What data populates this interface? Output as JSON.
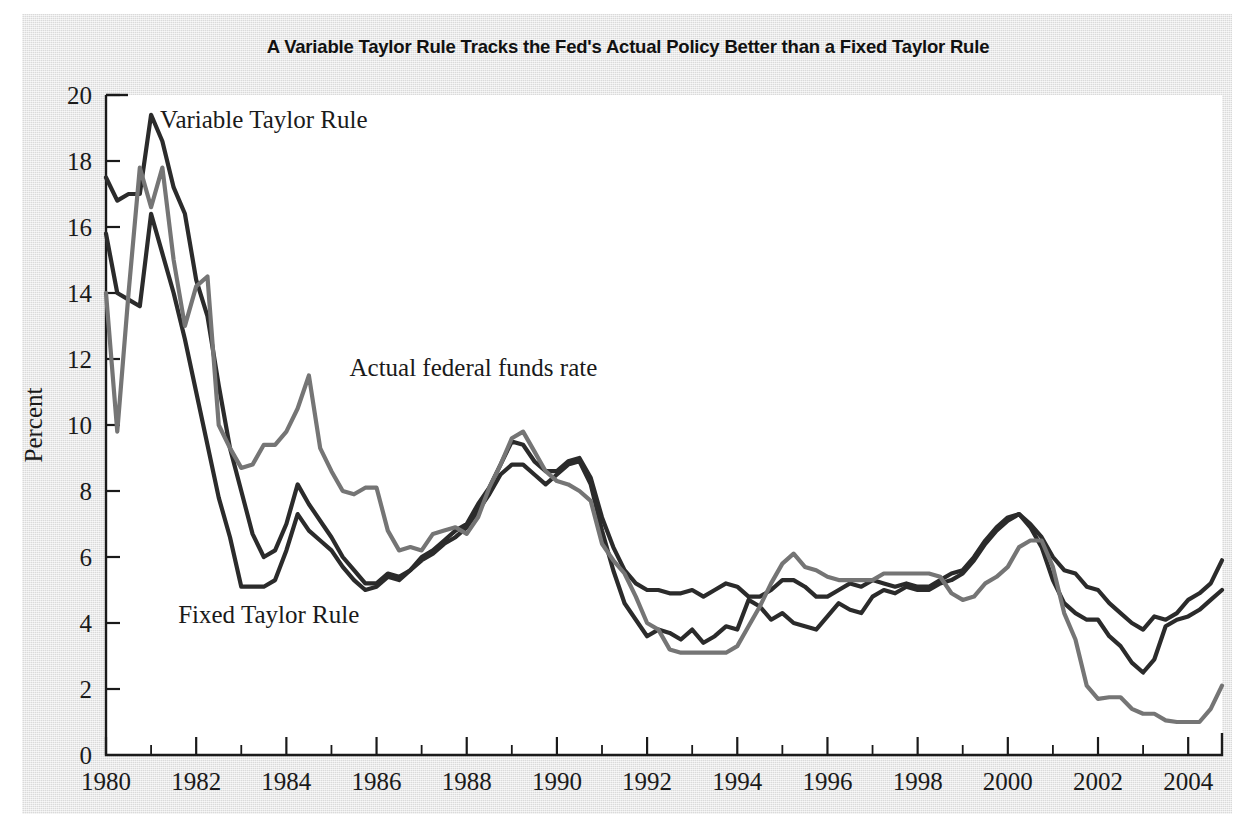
{
  "chart_data": {
    "type": "line",
    "title": "A Variable Taylor Rule Tracks the Fed's Actual Policy Better than a Fixed Taylor Rule",
    "xlabel": "",
    "ylabel": "Percent",
    "xlim": [
      1980.0,
      2004.75
    ],
    "ylim": [
      0,
      20
    ],
    "ytick_values": [
      0,
      2,
      4,
      6,
      8,
      10,
      12,
      14,
      16,
      18,
      20
    ],
    "ytick_labels": [
      "0",
      "2",
      "4",
      "6",
      "8",
      "10",
      "12",
      "14",
      "16",
      "18",
      "20"
    ],
    "xtick_values": [
      1980,
      1982,
      1984,
      1986,
      1988,
      1990,
      1992,
      1994,
      1996,
      1998,
      2000,
      2002,
      2004
    ],
    "xtick_labels": [
      "1980",
      "1982",
      "1984",
      "1986",
      "1988",
      "1990",
      "1992",
      "1994",
      "1996",
      "1998",
      "2000",
      "2002",
      "2004"
    ],
    "xminor_values": [
      1981,
      1983,
      1985,
      1987,
      1989,
      1991,
      1993,
      1995,
      1997,
      1999,
      2001,
      2003
    ],
    "grid": false,
    "legend_position": "inline-annotations",
    "x": [
      1980.0,
      1980.25,
      1980.5,
      1980.75,
      1981.0,
      1981.25,
      1981.5,
      1981.75,
      1982.0,
      1982.25,
      1982.5,
      1982.75,
      1983.0,
      1983.25,
      1983.5,
      1983.75,
      1984.0,
      1984.25,
      1984.5,
      1984.75,
      1985.0,
      1985.25,
      1985.5,
      1985.75,
      1986.0,
      1986.25,
      1986.5,
      1986.75,
      1987.0,
      1987.25,
      1987.5,
      1987.75,
      1988.0,
      1988.25,
      1988.5,
      1988.75,
      1989.0,
      1989.25,
      1989.5,
      1989.75,
      1990.0,
      1990.25,
      1990.5,
      1990.75,
      1991.0,
      1991.25,
      1991.5,
      1991.75,
      1992.0,
      1992.25,
      1992.5,
      1992.75,
      1993.0,
      1993.25,
      1993.5,
      1993.75,
      1994.0,
      1994.25,
      1994.5,
      1994.75,
      1995.0,
      1995.25,
      1995.5,
      1995.75,
      1996.0,
      1996.25,
      1996.5,
      1996.75,
      1997.0,
      1997.25,
      1997.5,
      1997.75,
      1998.0,
      1998.25,
      1998.5,
      1998.75,
      1999.0,
      1999.25,
      1999.5,
      1999.75,
      2000.0,
      2000.25,
      2000.5,
      2000.75,
      2001.0,
      2001.25,
      2001.5,
      2001.75,
      2002.0,
      2002.25,
      2002.5,
      2002.75,
      2003.0,
      2003.25,
      2003.5,
      2003.75,
      2004.0,
      2004.25,
      2004.5,
      2004.75
    ],
    "series": [
      {
        "name": "Variable Taylor Rule",
        "color": "#2b2b2b",
        "label_text": "Variable Taylor Rule",
        "values": [
          17.5,
          16.8,
          17.0,
          17.0,
          19.4,
          18.6,
          17.2,
          16.4,
          14.4,
          13.3,
          11.2,
          9.3,
          8.0,
          6.7,
          6.0,
          6.2,
          7.0,
          8.2,
          7.6,
          7.1,
          6.6,
          6.0,
          5.6,
          5.2,
          5.2,
          5.5,
          5.4,
          5.6,
          6.0,
          6.2,
          6.5,
          6.8,
          7.0,
          7.6,
          8.1,
          8.8,
          9.5,
          9.4,
          8.9,
          8.6,
          8.6,
          8.9,
          9.0,
          8.4,
          7.2,
          6.3,
          5.6,
          5.2,
          5.0,
          5.0,
          4.9,
          4.9,
          5.0,
          4.8,
          5.0,
          5.2,
          5.1,
          4.8,
          4.8,
          5.0,
          5.3,
          5.3,
          5.1,
          4.8,
          4.8,
          5.0,
          5.2,
          5.1,
          5.3,
          5.2,
          5.1,
          5.2,
          5.1,
          5.1,
          5.3,
          5.5,
          5.6,
          6.0,
          6.5,
          6.9,
          7.2,
          7.3,
          7.0,
          6.6,
          6.0,
          5.6,
          5.5,
          5.1,
          5.0,
          4.6,
          4.3,
          4.0,
          3.8,
          4.2,
          4.1,
          4.3,
          4.7,
          4.9,
          5.2,
          5.9
        ]
      },
      {
        "name": "Fixed Taylor Rule",
        "color": "#2b2b2b",
        "label_text": "Fixed Taylor Rule",
        "values": [
          15.8,
          14.0,
          13.8,
          13.6,
          16.4,
          15.2,
          14.0,
          12.6,
          11.0,
          9.4,
          7.8,
          6.6,
          5.1,
          5.1,
          5.1,
          5.3,
          6.2,
          7.3,
          6.8,
          6.5,
          6.2,
          5.7,
          5.3,
          5.0,
          5.1,
          5.4,
          5.3,
          5.6,
          5.9,
          6.1,
          6.4,
          6.6,
          6.9,
          7.4,
          7.9,
          8.5,
          8.8,
          8.8,
          8.5,
          8.2,
          8.5,
          8.8,
          8.9,
          8.2,
          6.8,
          5.6,
          4.6,
          4.1,
          3.6,
          3.8,
          3.7,
          3.5,
          3.8,
          3.4,
          3.6,
          3.9,
          3.8,
          4.7,
          4.5,
          4.1,
          4.3,
          4.0,
          3.9,
          3.8,
          4.2,
          4.6,
          4.4,
          4.3,
          4.8,
          5.0,
          4.9,
          5.1,
          5.0,
          5.0,
          5.2,
          5.3,
          5.5,
          5.9,
          6.4,
          6.8,
          7.1,
          7.3,
          6.9,
          6.3,
          5.3,
          4.6,
          4.3,
          4.1,
          4.1,
          3.6,
          3.3,
          2.8,
          2.5,
          2.9,
          3.9,
          4.1,
          4.2,
          4.4,
          4.7,
          5.0
        ]
      },
      {
        "name": "Actual federal funds rate",
        "color": "#757575",
        "label_text": "Actual federal funds rate",
        "values": [
          14.0,
          9.8,
          14.0,
          17.8,
          16.6,
          17.8,
          15.0,
          13.0,
          14.2,
          14.5,
          10.0,
          9.3,
          8.7,
          8.8,
          9.4,
          9.4,
          9.8,
          10.5,
          11.5,
          9.3,
          8.6,
          8.0,
          7.9,
          8.1,
          8.1,
          6.8,
          6.2,
          6.3,
          6.2,
          6.7,
          6.8,
          6.9,
          6.7,
          7.2,
          8.1,
          8.8,
          9.6,
          9.8,
          9.2,
          8.6,
          8.3,
          8.2,
          8.0,
          7.7,
          6.4,
          5.9,
          5.5,
          4.8,
          4.0,
          3.8,
          3.2,
          3.1,
          3.1,
          3.1,
          3.1,
          3.1,
          3.3,
          3.9,
          4.5,
          5.2,
          5.8,
          6.1,
          5.7,
          5.6,
          5.4,
          5.3,
          5.3,
          5.3,
          5.3,
          5.5,
          5.5,
          5.5,
          5.5,
          5.5,
          5.4,
          4.9,
          4.7,
          4.8,
          5.2,
          5.4,
          5.7,
          6.3,
          6.5,
          6.5,
          5.7,
          4.3,
          3.5,
          2.1,
          1.7,
          1.75,
          1.75,
          1.4,
          1.25,
          1.25,
          1.05,
          1.0,
          1.0,
          1.0,
          1.4,
          2.1
        ]
      }
    ],
    "annotations": [
      {
        "text": "Variable Taylor Rule",
        "x": 1981.2,
        "y": 19.0
      },
      {
        "text": "Actual federal funds rate",
        "x": 1985.4,
        "y": 11.5
      },
      {
        "text": "Fixed Taylor Rule",
        "x": 1981.6,
        "y": 4.0
      }
    ]
  }
}
